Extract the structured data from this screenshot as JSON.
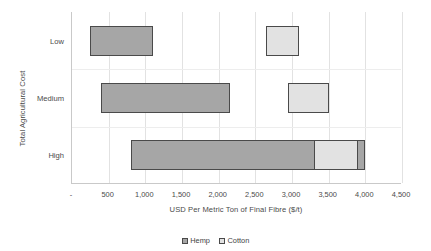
{
  "chart_data": {
    "type": "bar",
    "orientation": "horizontal",
    "title": "",
    "subtitle": "",
    "xlabel": "USD Per Metric Ton of Final Fibre ($/t)",
    "ylabel": "Total Agricultural Cost",
    "categories": [
      "Low",
      "Medium",
      "High"
    ],
    "xlim": [
      0,
      4500
    ],
    "xticks": [
      0,
      500,
      1000,
      1500,
      2000,
      2500,
      3000,
      3500,
      4000,
      4500
    ],
    "xticklabels": [
      "-",
      "500",
      "1,000",
      "1,500",
      "2,000",
      "2,500",
      "3,000",
      "3,500",
      "4,000",
      "4,500"
    ],
    "grid": true,
    "legend_position": "bottom",
    "note": "Floating range bars: each bar spans a min-max cost range per category.",
    "series": [
      {
        "name": "Hemp",
        "color": "#a6a6a6",
        "ranges": [
          {
            "category": "Low",
            "start": 250,
            "end": 1100
          },
          {
            "category": "Medium",
            "start": 400,
            "end": 2150
          },
          {
            "category": "High",
            "start": 800,
            "end": 4000
          }
        ]
      },
      {
        "name": "Cotton",
        "color": "#e2e2e2",
        "ranges": [
          {
            "category": "Low",
            "start": 2650,
            "end": 3100
          },
          {
            "category": "Medium",
            "start": 2950,
            "end": 3500
          },
          {
            "category": "High",
            "start": 3300,
            "end": 3900
          }
        ]
      }
    ]
  },
  "axes": {
    "y_title": "Total Agricultural Cost",
    "x_title": "USD Per Metric Ton of Final Fibre ($/t)",
    "category_labels": [
      "Low",
      "Medium",
      "High"
    ],
    "x_tick_labels": [
      "-",
      "500",
      "1,000",
      "1,500",
      "2,000",
      "2,500",
      "3,000",
      "3,500",
      "4,000",
      "4,500"
    ]
  },
  "legend": {
    "items": [
      {
        "label": "Hemp",
        "color": "#a6a6a6"
      },
      {
        "label": "Cotton",
        "color": "#e2e2e2"
      }
    ]
  },
  "colors": {
    "hemp": "#a6a6a6",
    "cotton": "#e2e2e2",
    "bar_outline": "#4a4a4a",
    "gridline": "#e2e2e2",
    "axis": "#c9c9c9",
    "text": "#4a4a4a",
    "background": "#ffffff"
  }
}
